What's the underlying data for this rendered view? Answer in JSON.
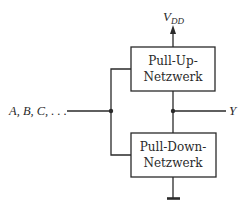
{
  "diagram": {
    "supply_label": "V",
    "supply_subscript": "DD",
    "input_label": "A, B, C, . . .",
    "output_label": "Y",
    "pull_up": {
      "line1": "Pull-Up-",
      "line2": "Netzwerk"
    },
    "pull_down": {
      "line1": "Pull-Down-",
      "line2": "Netzwerk"
    },
    "colors": {
      "stroke": "#2a2a2a",
      "background": "#ffffff"
    }
  }
}
